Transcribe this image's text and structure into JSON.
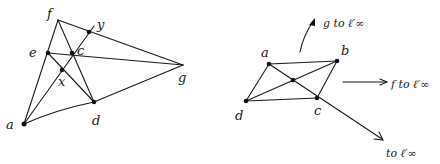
{
  "left_figure": {
    "points": {
      "f": {
        "label": "f",
        "x": 58,
        "y": 20,
        "lx": 47,
        "ly": 18,
        "dot": false
      },
      "y": {
        "label": "y",
        "x": 89,
        "y": 32,
        "lx": 97,
        "ly": 28,
        "dot": true
      },
      "e": {
        "label": "e",
        "x": 48,
        "y": 53,
        "lx": 29,
        "ly": 56,
        "dot": true
      },
      "c": {
        "label": "c",
        "x": 72,
        "y": 53,
        "lx": 77,
        "ly": 54,
        "dot": true
      },
      "x": {
        "label": "x",
        "x": 62,
        "y": 70,
        "lx": 58,
        "ly": 85,
        "dot": true
      },
      "g": {
        "label": "g",
        "x": 183,
        "y": 65,
        "lx": 178,
        "ly": 82,
        "dot": false
      },
      "d": {
        "label": "d",
        "x": 94,
        "y": 102,
        "lx": 92,
        "ly": 124,
        "dot": true
      },
      "a": {
        "label": "a",
        "x": 24,
        "y": 124,
        "lx": 6,
        "ly": 128,
        "dot": true
      }
    }
  },
  "right_figure": {
    "points": {
      "a": {
        "label": "a",
        "x": 269,
        "y": 64,
        "lx": 261,
        "ly": 56
      },
      "b": {
        "label": "b",
        "x": 337,
        "y": 61,
        "lx": 341,
        "ly": 54
      },
      "c": {
        "label": "c",
        "x": 317,
        "y": 98,
        "lx": 314,
        "ly": 114
      },
      "d": {
        "label": "d",
        "x": 246,
        "y": 101,
        "lx": 235,
        "ly": 119
      },
      "center": {
        "label": "",
        "x": 293,
        "y": 80
      }
    },
    "annotations": {
      "g_to": "g to ℓ′∞",
      "f_to": "f to ℓ′∞",
      "diag_to": "to ℓ′∞"
    }
  }
}
